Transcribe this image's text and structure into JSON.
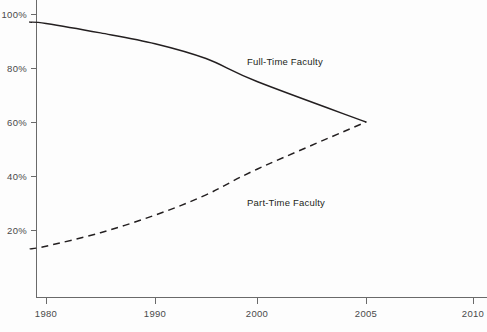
{
  "chart_data": {
    "type": "line",
    "title": "",
    "subtitle": "",
    "xlabel": "",
    "ylabel": "",
    "grid": false,
    "legend_position": "inline-annotation",
    "x_tick_labels": [
      "1980",
      "1990",
      "2000",
      "2005",
      "2010"
    ],
    "x_tick_values": [
      1980,
      1990,
      2000,
      2005,
      2010
    ],
    "y_tick_labels": [
      "20%",
      "40%",
      "60%",
      "80%",
      "100%"
    ],
    "y_tick_values": [
      20,
      40,
      60,
      80,
      100
    ],
    "ylim": [
      0,
      100
    ],
    "series": [
      {
        "name": "Full-Time Faculty",
        "style": "solid",
        "color": "#231f20",
        "x": [
          1978.5,
          1980,
          1985,
          1990,
          1995,
          2000,
          2005
        ],
        "values": [
          97,
          96.5,
          93,
          89,
          83.5,
          75,
          60
        ]
      },
      {
        "name": "Part-Time Faculty",
        "style": "dashed",
        "color": "#231f20",
        "x": [
          1978.5,
          1980,
          1985,
          1990,
          1995,
          2000,
          2005
        ],
        "values": [
          13,
          14,
          19,
          25.5,
          33,
          42.5,
          60
        ]
      }
    ],
    "annotations": [
      {
        "text": "Full-Time Faculty",
        "x_px": 247,
        "y_px": 62
      },
      {
        "text": "Part-Time Faculty",
        "x_px": 247,
        "y_px": 203
      }
    ]
  },
  "axes": {
    "y_ticks": [
      {
        "label": "100%",
        "y_px": 14
      },
      {
        "label": "80%",
        "y_px": 68
      },
      {
        "label": "60%",
        "y_px": 122
      },
      {
        "label": "40%",
        "y_px": 176
      },
      {
        "label": "20%",
        "y_px": 230
      }
    ],
    "x_ticks": [
      {
        "label": "1980",
        "x_px": 46
      },
      {
        "label": "1990",
        "x_px": 155
      },
      {
        "label": "2000",
        "x_px": 257
      },
      {
        "label": "2005",
        "x_px": 366
      },
      {
        "label": "2010",
        "x_px": 473
      }
    ]
  }
}
